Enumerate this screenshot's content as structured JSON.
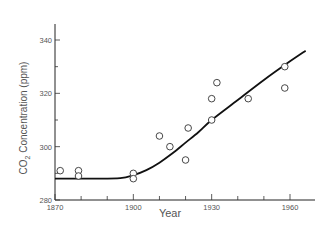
{
  "chart_data": {
    "type": "scatter",
    "title": "",
    "xlabel": "Year",
    "ylabel": "CO2 Concentration (ppm)",
    "ylabel_parts": {
      "pre": "CO",
      "sub": "2",
      "post": " Concentration (ppm)"
    },
    "xlim": [
      1870,
      1968
    ],
    "ylim": [
      280,
      345
    ],
    "x_ticks": [
      1870,
      1880,
      1890,
      1900,
      1910,
      1920,
      1930,
      1940,
      1950,
      1960
    ],
    "x_tick_labels": [
      "1870",
      "1900",
      "1930",
      "1960"
    ],
    "y_ticks": [
      280,
      290,
      300,
      310,
      320,
      330,
      340
    ],
    "y_tick_labels": [
      "280",
      "300",
      "320",
      "340"
    ],
    "grid": false,
    "legend": null,
    "series": [
      {
        "name": "Measurements",
        "kind": "scatter",
        "marker": "open-circle",
        "points": [
          {
            "x": 1872,
            "y": 291
          },
          {
            "x": 1879,
            "y": 291
          },
          {
            "x": 1879,
            "y": 289
          },
          {
            "x": 1900,
            "y": 290
          },
          {
            "x": 1900,
            "y": 288
          },
          {
            "x": 1910,
            "y": 304
          },
          {
            "x": 1914,
            "y": 300
          },
          {
            "x": 1920,
            "y": 295
          },
          {
            "x": 1921,
            "y": 307
          },
          {
            "x": 1930,
            "y": 310
          },
          {
            "x": 1930,
            "y": 318
          },
          {
            "x": 1932,
            "y": 324
          },
          {
            "x": 1944,
            "y": 318
          },
          {
            "x": 1958,
            "y": 330
          },
          {
            "x": 1958,
            "y": 322
          }
        ]
      },
      {
        "name": "Trend curve",
        "kind": "line",
        "points": [
          {
            "x": 1870,
            "y": 288
          },
          {
            "x": 1885,
            "y": 288
          },
          {
            "x": 1895,
            "y": 288.2
          },
          {
            "x": 1900,
            "y": 289.3
          },
          {
            "x": 1905,
            "y": 291.2
          },
          {
            "x": 1910,
            "y": 294
          },
          {
            "x": 1915,
            "y": 297.5
          },
          {
            "x": 1920,
            "y": 301.5
          },
          {
            "x": 1925,
            "y": 305.5
          },
          {
            "x": 1930,
            "y": 310
          },
          {
            "x": 1940,
            "y": 317.5
          },
          {
            "x": 1950,
            "y": 325
          },
          {
            "x": 1960,
            "y": 332
          },
          {
            "x": 1966,
            "y": 336
          }
        ]
      }
    ]
  }
}
